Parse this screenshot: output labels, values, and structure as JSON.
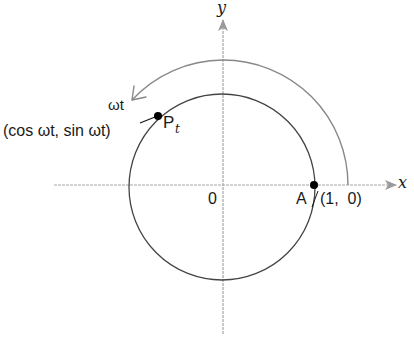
{
  "diagram": {
    "type": "unit-circle-rotation",
    "axes": {
      "x_label": "x",
      "y_label": "y",
      "origin_label": "0"
    },
    "points": {
      "A": {
        "name": "A",
        "coords": "(1,  0)"
      },
      "P": {
        "name": "P",
        "subscript": "t",
        "coords": "(cos ωt, sin ωt)"
      }
    },
    "angle_label": "ωt",
    "colors": {
      "circle": "#444444",
      "axes": "#9a9a9a",
      "arrow": "#888888",
      "points": "#000000"
    }
  }
}
